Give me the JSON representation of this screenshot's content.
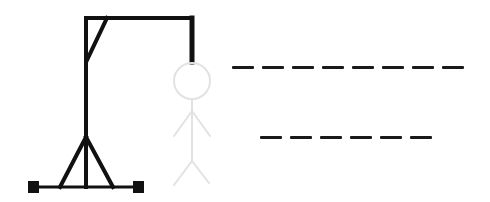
{
  "game": {
    "name": "Hangman",
    "colors": {
      "gallows": "#111111",
      "figure": "#e2e2e2",
      "blank": "#1a1a1a",
      "background": "#ffffff"
    },
    "words": [
      {
        "letters": 8,
        "revealed": [
          "",
          "",
          "",
          "",
          "",
          "",
          "",
          ""
        ]
      },
      {
        "letters": 6,
        "revealed": [
          "",
          "",
          "",
          "",
          "",
          ""
        ]
      }
    ],
    "figure_parts_shown": [
      "head",
      "body",
      "left-arm",
      "right-arm",
      "left-leg",
      "right-leg"
    ],
    "figure_state": "faded"
  }
}
